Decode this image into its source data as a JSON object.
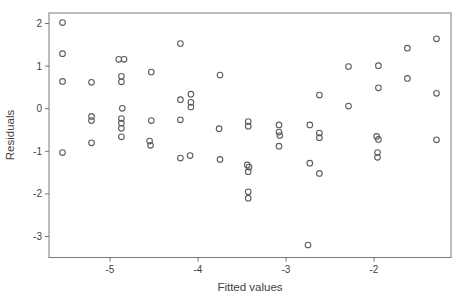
{
  "figure": {
    "background": "#ffffff",
    "box_color": "#7a7a7a",
    "tick_color": "#6e6e6e",
    "point_color": "#5c5c5c",
    "text_color": "#3f3f3f"
  },
  "chart_data": {
    "type": "scatter",
    "title": "",
    "xlabel": "Fitted values",
    "ylabel": "Residuals",
    "xlim": [
      -5.693,
      -1.125
    ],
    "ylim": [
      -3.493,
      2.246
    ],
    "xticks": [
      -5,
      -4,
      -3,
      -2
    ],
    "yticks": [
      -3,
      -2,
      -1,
      0,
      1,
      2
    ],
    "grid": false,
    "legend": null,
    "marker": "open-circle",
    "marker_radius": 2.8,
    "points": [
      [
        -5.54,
        2.02
      ],
      [
        -5.54,
        1.29
      ],
      [
        -5.54,
        0.64
      ],
      [
        -5.54,
        -1.03
      ],
      [
        -5.21,
        0.62
      ],
      [
        -5.21,
        -0.18
      ],
      [
        -5.21,
        -0.28
      ],
      [
        -5.21,
        -0.8
      ],
      [
        -4.9,
        1.16
      ],
      [
        -4.84,
        1.16
      ],
      [
        -4.87,
        0.76
      ],
      [
        -4.87,
        0.63
      ],
      [
        -4.86,
        0.01
      ],
      [
        -4.87,
        -0.23
      ],
      [
        -4.87,
        -0.34
      ],
      [
        -4.87,
        -0.46
      ],
      [
        -4.87,
        -0.66
      ],
      [
        -4.53,
        0.86
      ],
      [
        -4.53,
        -0.28
      ],
      [
        -4.55,
        -0.76
      ],
      [
        -4.54,
        -0.86
      ],
      [
        -4.2,
        1.53
      ],
      [
        -4.2,
        0.21
      ],
      [
        -4.2,
        -0.26
      ],
      [
        -4.2,
        -1.16
      ],
      [
        -4.08,
        0.34
      ],
      [
        -4.08,
        0.15
      ],
      [
        -4.08,
        0.04
      ],
      [
        -4.09,
        -1.1
      ],
      [
        -3.75,
        0.79
      ],
      [
        -3.76,
        -0.47
      ],
      [
        -3.75,
        -1.19
      ],
      [
        -3.43,
        -0.3
      ],
      [
        -3.43,
        -0.41
      ],
      [
        -3.44,
        -1.32
      ],
      [
        -3.42,
        -1.37
      ],
      [
        -3.43,
        -1.48
      ],
      [
        -3.43,
        -1.95
      ],
      [
        -3.43,
        -2.1
      ],
      [
        -3.08,
        -0.38
      ],
      [
        -3.08,
        -0.55
      ],
      [
        -3.07,
        -0.63
      ],
      [
        -3.08,
        -0.88
      ],
      [
        -2.73,
        -0.38
      ],
      [
        -2.62,
        0.32
      ],
      [
        -2.62,
        -0.57
      ],
      [
        -2.62,
        -0.68
      ],
      [
        -2.73,
        -1.28
      ],
      [
        -2.62,
        -1.52
      ],
      [
        -2.75,
        -3.2
      ],
      [
        -2.29,
        0.99
      ],
      [
        -2.29,
        0.06
      ],
      [
        -1.95,
        1.01
      ],
      [
        -1.95,
        0.49
      ],
      [
        -1.97,
        -0.65
      ],
      [
        -1.95,
        -0.72
      ],
      [
        -1.96,
        -1.03
      ],
      [
        -1.96,
        -1.14
      ],
      [
        -1.62,
        1.42
      ],
      [
        -1.62,
        0.71
      ],
      [
        -1.29,
        1.64
      ],
      [
        -1.29,
        0.36
      ],
      [
        -1.29,
        -0.73
      ]
    ]
  }
}
